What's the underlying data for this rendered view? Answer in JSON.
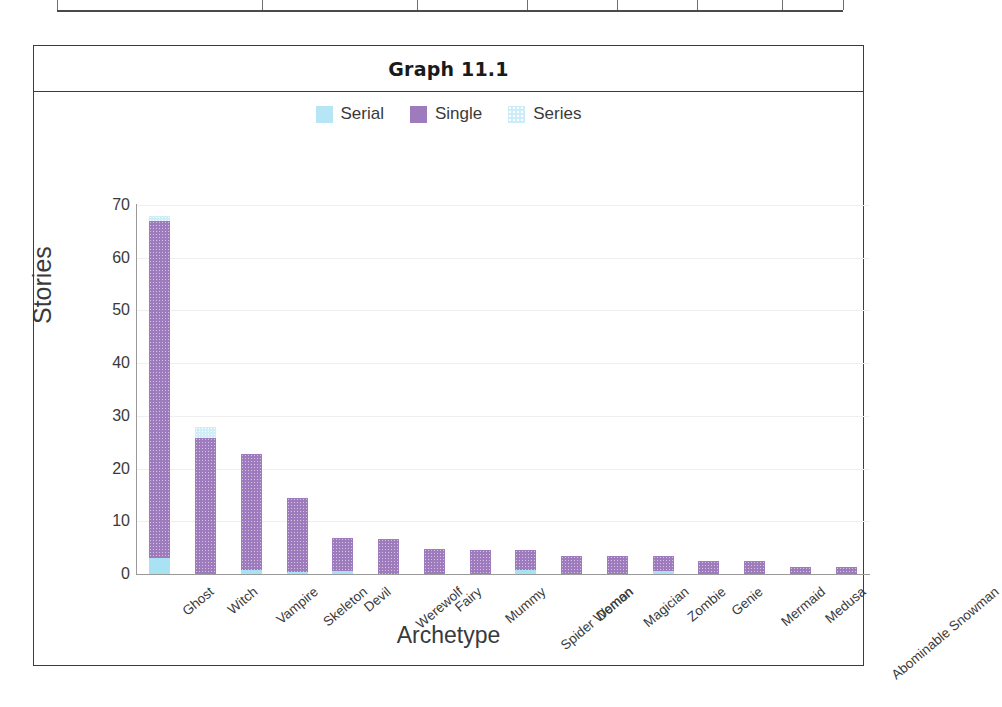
{
  "figure": {
    "title": "Graph 11.1"
  },
  "table_fragment": {
    "divider_positions": [
      0,
      205,
      360,
      470,
      560,
      640,
      725,
      786
    ]
  },
  "chart_data": {
    "type": "bar",
    "stacked": true,
    "title": "Graph 11.1",
    "xlabel": "Archetype",
    "ylabel": "Stories",
    "ylim": [
      0,
      70
    ],
    "yticks": [
      0,
      10,
      20,
      30,
      40,
      50,
      60,
      70
    ],
    "grid": true,
    "legend_position": "top-center",
    "categories": [
      "Ghost",
      "Witch",
      "Vampire",
      "Skeleton",
      "Devil",
      "Werewolf",
      "Fairy",
      "Mummy",
      "Spider Woman",
      "Demon",
      "Magician",
      "Zombie",
      "Genie",
      "Mermaid",
      "Medusa",
      "Abominable Snowman"
    ],
    "series": [
      {
        "name": "Serial",
        "color": "#a9e2f3",
        "values": [
          3.0,
          0,
          0.8,
          0.3,
          0.5,
          0,
          0,
          0,
          0.7,
          0,
          0,
          0.6,
          0,
          0,
          0,
          0
        ]
      },
      {
        "name": "Single",
        "color": "#9d7bbd",
        "values": [
          64.0,
          25.8,
          21.9,
          14.2,
          6.3,
          6.6,
          4.8,
          4.6,
          3.9,
          3.5,
          3.4,
          2.8,
          2.4,
          2.4,
          1.4,
          1.4
        ]
      },
      {
        "name": "Series",
        "color": "#cfeef8",
        "values": [
          1.0,
          2.0,
          0,
          0,
          0,
          0,
          0,
          0,
          0,
          0,
          0,
          0,
          0,
          0,
          0,
          0
        ]
      }
    ],
    "totals": [
      68.0,
      27.8,
      22.7,
      14.5,
      6.8,
      6.6,
      4.8,
      4.6,
      4.6,
      3.5,
      3.4,
      3.4,
      2.4,
      2.4,
      1.4,
      1.4
    ]
  },
  "legend": {
    "items": [
      {
        "label": "Serial",
        "swatch": "sw-serial"
      },
      {
        "label": "Single",
        "swatch": "sw-single"
      },
      {
        "label": "Series",
        "swatch": "sw-series"
      }
    ]
  }
}
